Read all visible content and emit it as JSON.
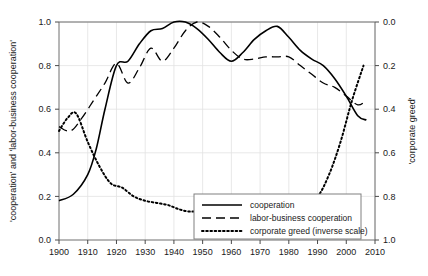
{
  "chart_data": {
    "type": "line",
    "title": "",
    "xlabel": "",
    "ylabel": "'cooperation' and 'labor-business cooperation'",
    "y2label": "'corporate greed'",
    "xlim": [
      1900,
      2010
    ],
    "ylim": [
      0.0,
      1.0
    ],
    "y2lim": [
      1.0,
      0.0
    ],
    "y2_inverted": true,
    "grid": true,
    "legend_position": "bottom-right",
    "xticks": [
      1900,
      1910,
      1920,
      1930,
      1940,
      1950,
      1960,
      1970,
      1980,
      1990,
      2000,
      2010
    ],
    "xtick_labels": [
      "1900",
      "1910",
      "1920",
      "1930",
      "1940",
      "1950",
      "1960",
      "1970",
      "1980",
      "1990",
      "2000",
      "2010"
    ],
    "yticks": [
      0.0,
      0.2,
      0.4,
      0.6,
      0.8,
      1.0
    ],
    "ytick_labels": [
      "0.0",
      "0.2",
      "0.4",
      "0.6",
      "0.8",
      "1.0"
    ],
    "y2ticks": [
      0.0,
      0.2,
      0.4,
      0.6,
      0.8,
      1.0
    ],
    "y2tick_labels": [
      "0.0",
      "0.2",
      "0.4",
      "0.6",
      "0.8",
      "1.0"
    ],
    "series": [
      {
        "name": "cooperation",
        "style": "solid",
        "axis": "left",
        "color": "#000000",
        "x": [
          1900,
          1905,
          1910,
          1913,
          1916,
          1920,
          1924,
          1928,
          1932,
          1936,
          1940,
          1944,
          1948,
          1952,
          1956,
          1960,
          1964,
          1968,
          1972,
          1976,
          1980,
          1984,
          1988,
          1992,
          1996,
          2000,
          2004,
          2007
        ],
        "y": [
          0.18,
          0.21,
          0.3,
          0.42,
          0.6,
          0.8,
          0.82,
          0.9,
          0.96,
          0.97,
          1.0,
          1.0,
          0.97,
          0.92,
          0.86,
          0.82,
          0.86,
          0.92,
          0.96,
          0.98,
          0.93,
          0.87,
          0.83,
          0.8,
          0.74,
          0.66,
          0.57,
          0.55
        ]
      },
      {
        "name": "labor-business cooperation",
        "style": "dashed",
        "axis": "left",
        "color": "#000000",
        "x": [
          1900,
          1904,
          1908,
          1912,
          1916,
          1920,
          1924,
          1928,
          1932,
          1936,
          1940,
          1944,
          1948,
          1952,
          1956,
          1960,
          1964,
          1968,
          1972,
          1976,
          1980,
          1984,
          1988,
          1992,
          1996,
          2000,
          2004,
          2007
        ],
        "y": [
          0.52,
          0.5,
          0.56,
          0.64,
          0.72,
          0.81,
          0.72,
          0.79,
          0.88,
          0.82,
          0.88,
          0.96,
          1.0,
          0.98,
          0.93,
          0.87,
          0.83,
          0.83,
          0.84,
          0.84,
          0.84,
          0.8,
          0.76,
          0.72,
          0.7,
          0.66,
          0.62,
          0.64
        ]
      },
      {
        "name": "corporate greed (inverse scale)",
        "style": "dotted",
        "axis": "right",
        "color": "#000000",
        "x": [
          1900,
          1903,
          1906,
          1910,
          1914,
          1918,
          1922,
          1926,
          1930,
          1934,
          1938,
          1942,
          1946,
          1950,
          1954,
          1958,
          1962,
          1966,
          1970,
          1974,
          1978,
          1982,
          1986,
          1990,
          1994,
          1998,
          2002,
          2006
        ],
        "y": [
          0.5,
          0.44,
          0.42,
          0.55,
          0.66,
          0.74,
          0.76,
          0.8,
          0.82,
          0.83,
          0.84,
          0.86,
          0.87,
          0.86,
          0.85,
          0.88,
          0.92,
          0.94,
          0.93,
          0.86,
          0.82,
          0.81,
          0.81,
          0.8,
          0.7,
          0.55,
          0.36,
          0.2
        ]
      }
    ]
  },
  "legend": {
    "items": [
      {
        "label": "cooperation",
        "style": "solid"
      },
      {
        "label": "labor-business cooperation",
        "style": "dashed"
      },
      {
        "label": "corporate greed (inverse scale)",
        "style": "dotted"
      }
    ]
  }
}
